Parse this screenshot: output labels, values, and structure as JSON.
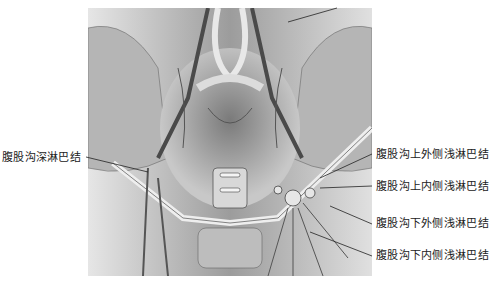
{
  "figure": {
    "palette": {
      "bg": "#cfcfcf",
      "dark": "#3a3a3a",
      "mid": "#8a8a8a",
      "light": "#ececec"
    }
  },
  "labels": {
    "left": [
      {
        "text": "腹股沟深淋巴结"
      }
    ],
    "right": [
      {
        "text": "腹股沟上外侧浅淋巴结"
      },
      {
        "text": "腹股沟上内侧浅淋巴结"
      },
      {
        "text": "腹股沟下外侧浅淋巴结"
      },
      {
        "text": "腹股沟下内侧浅淋巴结"
      }
    ]
  }
}
